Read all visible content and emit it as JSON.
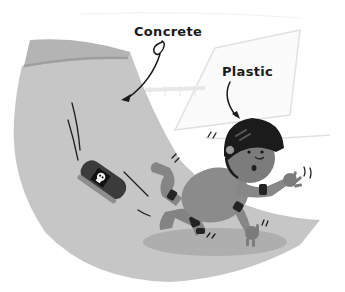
{
  "illustration": {
    "subject": "child falling off skateboard on a skate ramp",
    "labels": {
      "concrete": "Concrete",
      "plastic": "Plastic"
    },
    "colors": {
      "ramp": "#c8c8c8",
      "ramp_edge": "#a3a3a3",
      "ramp_top": "#b5b5b5",
      "background_ramp_outline": "#e3e3e3",
      "helmet": "#1c1c1c",
      "skin": "#7a7a7a",
      "clothing": "#8c8c8c",
      "pads": "#262626",
      "skateboard": "#3d3d3d",
      "shadow": "#9a9a9a",
      "ink": "#1a1a1a"
    },
    "icons": {
      "skull": "skull-sticker-icon",
      "arrow": "pointer-arrow-icon"
    }
  }
}
